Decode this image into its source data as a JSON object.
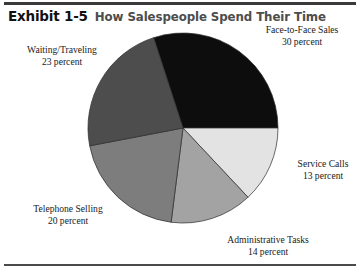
{
  "header": {
    "exhibit_number": "Exhibit 1-5",
    "exhibit_title": "How Salespeople Spend Their Time"
  },
  "chart_data": {
    "type": "pie",
    "title": "How Salespeople Spend Their Time",
    "unit": "percent",
    "total": 100,
    "legend_position": "callout-labels",
    "grid": false,
    "slices": [
      {
        "label": "Face-to-Face Sales",
        "value": 30,
        "value_text": "30 percent",
        "color": "#0d0d0d",
        "start_angle_deg": -18,
        "end_angle_deg": 90
      },
      {
        "label": "Service Calls",
        "value": 13,
        "value_text": "13 percent",
        "color": "#e3e3e3",
        "start_angle_deg": 90,
        "end_angle_deg": 136.8
      },
      {
        "label": "Administrative Tasks",
        "value": 14,
        "value_text": "14 percent",
        "color": "#a3a3a3",
        "start_angle_deg": 136.8,
        "end_angle_deg": 187.2
      },
      {
        "label": "Telephone Selling",
        "value": 20,
        "value_text": "20 percent",
        "color": "#7d7d7d",
        "start_angle_deg": 187.2,
        "end_angle_deg": 259.2
      },
      {
        "label": "Waiting/Traveling",
        "value": 23,
        "value_text": "23 percent",
        "color": "#4d4d4d",
        "start_angle_deg": 259.2,
        "end_angle_deg": 342
      }
    ]
  },
  "labels": {
    "face": {
      "name": "Face-to-Face Sales",
      "value": "30 percent"
    },
    "service": {
      "name": "Service Calls",
      "value": "13 percent"
    },
    "admin": {
      "name": "Administrative Tasks",
      "value": "14 percent"
    },
    "phone": {
      "name": "Telephone Selling",
      "value": "20 percent"
    },
    "waiting": {
      "name": "Waiting/Traveling",
      "value": "23 percent"
    }
  },
  "colors": {
    "rule": "#3a3a3a",
    "title_accent": "#4d4d4d",
    "text": "#1a1a1a",
    "background": "#ffffff"
  }
}
